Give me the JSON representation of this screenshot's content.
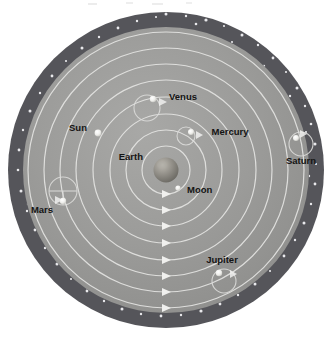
{
  "diagram": {
    "type": "astronomical-orbital-diagram",
    "center_body": "Earth",
    "orbit_direction": "counterclockwise",
    "colors": {
      "background": "#ffffff",
      "disk": "#9a9a9a",
      "starfield_band": "#555558",
      "star_dot": "#e8e8ea",
      "orbit_line": "#e2e2e2",
      "epicycle_line": "#d8d8d8",
      "body_marker": "#f2f2f0",
      "label_text": "#141414",
      "earth_body": "#8e8c86"
    },
    "geometry": {
      "cx": 166,
      "cy": 170,
      "disk_outer_r": 158,
      "starfield_inner_r": 143,
      "orbit_radii": [
        24,
        40,
        56,
        73,
        90,
        106,
        122,
        138
      ]
    }
  },
  "labels": [
    {
      "name": "earth",
      "text": "Earth",
      "x": 143,
      "y": 160,
      "anchor": "end"
    },
    {
      "name": "moon",
      "text": "Moon",
      "x": 187,
      "y": 193,
      "anchor": "start"
    },
    {
      "name": "sun",
      "text": "Sun",
      "x": 78,
      "y": 131,
      "anchor": "middle"
    },
    {
      "name": "venus",
      "text": "Venus",
      "x": 183,
      "y": 100,
      "anchor": "middle"
    },
    {
      "name": "mercury",
      "text": "Mercury",
      "x": 230,
      "y": 135,
      "anchor": "middle"
    },
    {
      "name": "mars",
      "text": "Mars",
      "x": 42,
      "y": 213,
      "anchor": "middle"
    },
    {
      "name": "jupiter",
      "text": "Jupiter",
      "x": 222,
      "y": 263,
      "anchor": "middle"
    },
    {
      "name": "saturn",
      "text": "Saturn",
      "x": 301,
      "y": 164,
      "anchor": "middle"
    }
  ],
  "bodies": [
    {
      "name": "moon",
      "label": "Moon",
      "x": 178,
      "y": 188,
      "r": 2.6,
      "epicycle": null
    },
    {
      "name": "sun",
      "label": "Sun",
      "x": 98,
      "y": 133,
      "r": 3.4,
      "epicycle": null
    },
    {
      "name": "venus",
      "label": "Venus",
      "x": 153,
      "y": 99,
      "r": 3.2,
      "epicycle": {
        "cx": 147,
        "cy": 108,
        "r": 13
      }
    },
    {
      "name": "mercury",
      "label": "Mercury",
      "x": 191,
      "y": 132,
      "r": 3.0,
      "epicycle": {
        "cx": 186,
        "cy": 136,
        "r": 9
      }
    },
    {
      "name": "mars",
      "label": "Mars",
      "x": 63,
      "y": 201,
      "r": 3.2,
      "epicycle": {
        "cx": 63,
        "cy": 191,
        "r": 14
      }
    },
    {
      "name": "jupiter",
      "label": "Jupiter",
      "x": 219,
      "y": 273,
      "r": 3.2,
      "epicycle": {
        "cx": 224,
        "cy": 281,
        "r": 12
      }
    },
    {
      "name": "saturn",
      "label": "Saturn",
      "x": 296,
      "y": 138,
      "r": 3.0,
      "epicycle": {
        "cx": 301,
        "cy": 144,
        "r": 12
      }
    }
  ],
  "orbit_arrows": [
    {
      "name": "arrow-orbit-1",
      "x": 166,
      "y": 194,
      "ring": 1
    },
    {
      "name": "arrow-orbit-2",
      "x": 166,
      "y": 210,
      "ring": 2
    },
    {
      "name": "arrow-orbit-3",
      "x": 166,
      "y": 226,
      "ring": 3
    },
    {
      "name": "arrow-orbit-4",
      "x": 166,
      "y": 243,
      "ring": 4
    },
    {
      "name": "arrow-orbit-5",
      "x": 166,
      "y": 260,
      "ring": 5
    },
    {
      "name": "arrow-orbit-6",
      "x": 166,
      "y": 276,
      "ring": 6
    },
    {
      "name": "arrow-orbit-7",
      "x": 166,
      "y": 292,
      "ring": 7
    },
    {
      "name": "arrow-orbit-8",
      "x": 166,
      "y": 308,
      "ring": 8
    }
  ]
}
